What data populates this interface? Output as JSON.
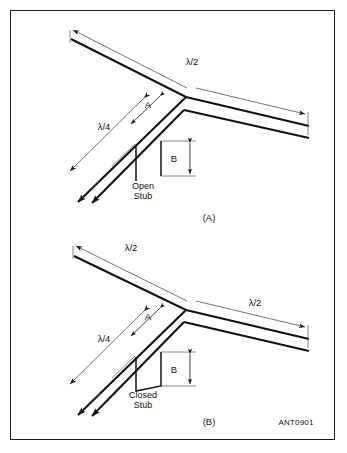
{
  "figure": {
    "code": "ANT0901",
    "panels": [
      {
        "id": "A",
        "caption": "(A)",
        "stub_label_line1": "Open",
        "stub_label_line2": "Stub",
        "stub_type": "open-stub",
        "dimensions": {
          "left_line": "λ/2",
          "right_line": "λ/2",
          "quarter": "λ/4",
          "a": "A",
          "b": "B"
        }
      },
      {
        "id": "B",
        "caption": "(B)",
        "stub_label_line1": "Closed",
        "stub_label_line2": "Stub",
        "stub_type": "closed-stub",
        "dimensions": {
          "left_line": "λ/2",
          "right_line": "λ/2",
          "quarter": "λ/4",
          "a": "A",
          "b": "B"
        }
      }
    ],
    "colors": {
      "conductor": "#111111",
      "dimension": "#444444",
      "border": "#1b1b1b",
      "background": "#ffffff"
    }
  }
}
